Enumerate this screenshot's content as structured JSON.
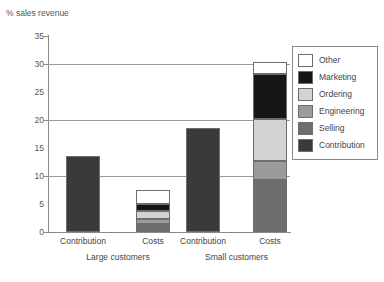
{
  "chart_data": {
    "type": "bar",
    "subtype": "stacked-bar-grouped",
    "title": "",
    "ylabel": "% sales revenue",
    "xlabel": "",
    "ylim": [
      0,
      35
    ],
    "yticks": [
      0,
      5,
      10,
      15,
      20,
      25,
      30,
      35
    ],
    "gridlines": [
      10,
      20,
      30
    ],
    "grid": true,
    "legend_position": "right",
    "groups": [
      "Large customers",
      "Small customers"
    ],
    "categories": [
      "Contribution",
      "Costs",
      "Contribution",
      "Costs"
    ],
    "series": [
      {
        "name": "Contribution",
        "color": "#3a3a3a",
        "values": [
          13.6,
          0,
          18.6,
          0
        ]
      },
      {
        "name": "Selling",
        "color": "#6e6e6e",
        "values": [
          0,
          1.4,
          0,
          9.3
        ]
      },
      {
        "name": "Engineering",
        "color": "#9b9b9b",
        "values": [
          0,
          1.0,
          0,
          3.3
        ]
      },
      {
        "name": "Ordering",
        "color": "#d3d3d3",
        "values": [
          0,
          1.4,
          0,
          7.5
        ]
      },
      {
        "name": "Marketing",
        "color": "#161616",
        "values": [
          0,
          1.2,
          0,
          8.2
        ]
      },
      {
        "name": "Other",
        "color": "#ffffff",
        "values": [
          0,
          2.5,
          0,
          2.0
        ]
      }
    ],
    "bars": [
      {
        "id": "large-contribution",
        "group": "Large customers",
        "label": "Contribution",
        "total": 13.6,
        "stack": [
          {
            "name": "Contribution",
            "value": 13.6,
            "color": "#3a3a3a"
          }
        ]
      },
      {
        "id": "large-costs",
        "group": "Large customers",
        "label": "Costs",
        "total": 7.5,
        "stack": [
          {
            "name": "Selling",
            "value": 1.4,
            "color": "#6e6e6e"
          },
          {
            "name": "Engineering",
            "value": 1.0,
            "color": "#9b9b9b"
          },
          {
            "name": "Ordering",
            "value": 1.4,
            "color": "#d3d3d3"
          },
          {
            "name": "Marketing",
            "value": 1.2,
            "color": "#161616"
          },
          {
            "name": "Other",
            "value": 2.5,
            "color": "#ffffff"
          }
        ]
      },
      {
        "id": "small-contribution",
        "group": "Small customers",
        "label": "Contribution",
        "total": 18.6,
        "stack": [
          {
            "name": "Contribution",
            "value": 18.6,
            "color": "#3a3a3a"
          }
        ]
      },
      {
        "id": "small-costs",
        "group": "Small customers",
        "label": "Costs",
        "total": 30.3,
        "stack": [
          {
            "name": "Selling",
            "value": 9.3,
            "color": "#6e6e6e"
          },
          {
            "name": "Engineering",
            "value": 3.3,
            "color": "#9b9b9b"
          },
          {
            "name": "Ordering",
            "value": 7.5,
            "color": "#d3d3d3"
          },
          {
            "name": "Marketing",
            "value": 8.2,
            "color": "#161616"
          },
          {
            "name": "Other",
            "value": 2.0,
            "color": "#ffffff"
          }
        ]
      }
    ]
  },
  "legend": {
    "entries": [
      {
        "label": "Other",
        "color": "#ffffff"
      },
      {
        "label": "Marketing",
        "color": "#161616"
      },
      {
        "label": "Ordering",
        "color": "#d3d3d3"
      },
      {
        "label": "Engineering",
        "color": "#9b9b9b"
      },
      {
        "label": "Selling",
        "color": "#6e6e6e"
      },
      {
        "label": "Contribution",
        "color": "#3a3a3a"
      }
    ]
  },
  "colors": {
    "axis": "#8a8a8a",
    "grid": "#9a9a9a",
    "text": "#4a4a4a",
    "border": "#6d6d6d",
    "background": "#ffffff"
  }
}
